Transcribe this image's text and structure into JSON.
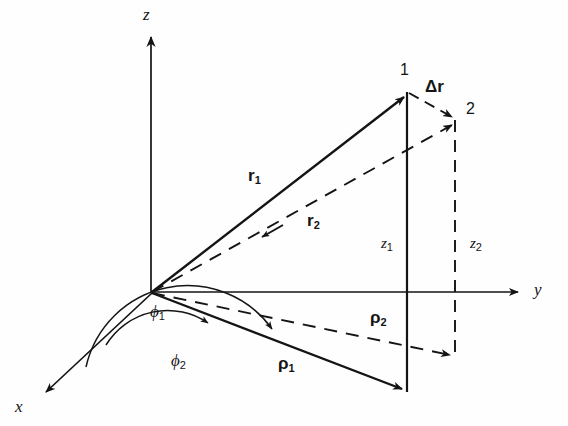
{
  "figure": {
    "kind": "vector-diagram",
    "background": "#fefefe",
    "ink": "#141414"
  },
  "axes": [
    {
      "name": "z-axis",
      "label": "z",
      "direction": "up",
      "label_x": 143,
      "label_y": 6
    },
    {
      "name": "y-axis",
      "label": "y",
      "direction": "right",
      "label_x": 534,
      "label_y": 281
    },
    {
      "name": "x-axis",
      "label": "x",
      "direction": "down-left",
      "label_x": 15,
      "label_y": 398
    }
  ],
  "points": [
    {
      "name": "point-1",
      "label": "1",
      "x": 400,
      "y": 62,
      "tip_x": 407,
      "tip_y": 92
    },
    {
      "name": "point-2",
      "label": "2",
      "x": 466,
      "y": 101,
      "tip_x": 455,
      "tip_y": 120
    }
  ],
  "vectors": [
    {
      "name": "r1",
      "label": "r",
      "sub": "1",
      "style": "solid",
      "label_x": 248,
      "label_y": 167
    },
    {
      "name": "r2",
      "label": "r",
      "sub": "2",
      "style": "dashed",
      "label_x": 307,
      "label_y": 212
    },
    {
      "name": "rho1",
      "label": "ρ",
      "sub": "1",
      "style": "solid",
      "label_x": 278,
      "label_y": 355
    },
    {
      "name": "rho2",
      "label": "ρ",
      "sub": "2",
      "style": "dashed",
      "label_x": 370,
      "label_y": 309
    },
    {
      "name": "delta-r",
      "label": "Δr",
      "sub": "",
      "style": "dashed",
      "label_x": 425,
      "label_y": 78
    }
  ],
  "components": [
    {
      "name": "z1",
      "label": "z",
      "sub": "1",
      "style": "solid",
      "label_x": 381,
      "label_y": 236
    },
    {
      "name": "z2",
      "label": "z",
      "sub": "2",
      "style": "dashed",
      "label_x": 470,
      "label_y": 236
    }
  ],
  "angles": [
    {
      "name": "phi1",
      "label": "ϕ",
      "sub": "1",
      "label_x": 150,
      "label_y": 303
    },
    {
      "name": "phi2",
      "label": "ϕ",
      "sub": "2",
      "label_x": 171,
      "label_y": 352
    }
  ]
}
